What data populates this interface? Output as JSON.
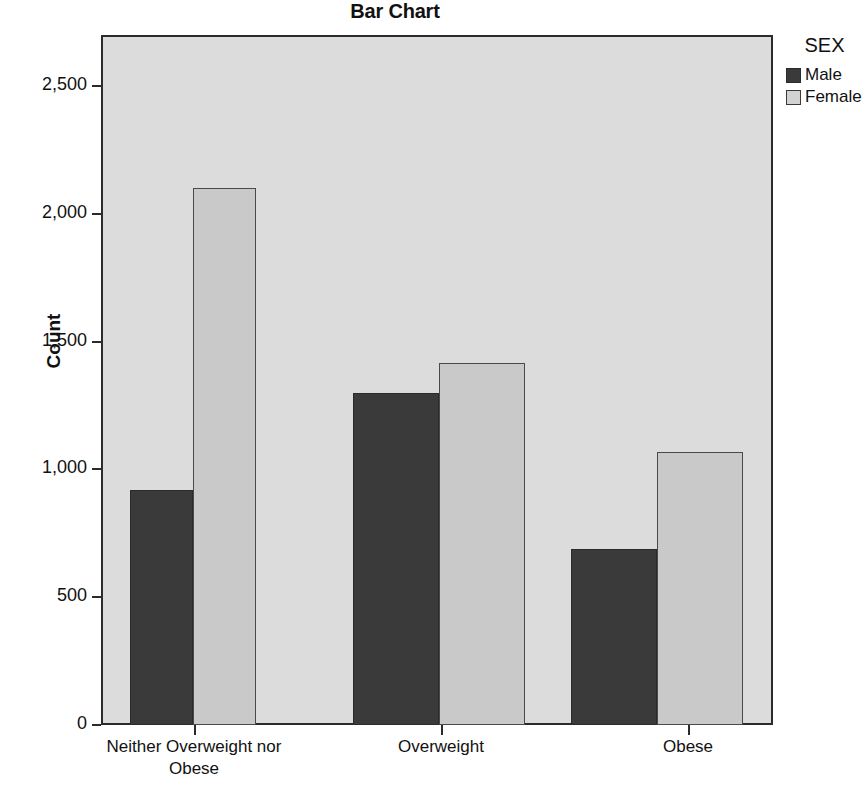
{
  "chart_data": {
    "type": "bar",
    "title": "Bar Chart",
    "xlabel": "",
    "ylabel": "Count",
    "categories": [
      "Neither Overweight nor Obese",
      "Overweight",
      "Obese"
    ],
    "category_lines": [
      [
        "Neither Overweight nor",
        "Obese"
      ],
      [
        "Overweight"
      ],
      [
        "Obese"
      ]
    ],
    "legend_title": "SEX",
    "legend_position": "right",
    "grid": false,
    "ylim": [
      0,
      2700
    ],
    "yticks": [
      0,
      500,
      1000,
      1500,
      2000,
      2500
    ],
    "ytick_labels": [
      "0",
      "500",
      "1,000",
      "1,500",
      "2,000",
      "2,500"
    ],
    "series": [
      {
        "name": "Male",
        "color": "#3a3a3a",
        "values": [
          920,
          1300,
          690
        ]
      },
      {
        "name": "Female",
        "color": "#c9c9c9",
        "values": [
          2100,
          1415,
          1070
        ]
      }
    ]
  },
  "colors": {
    "plot_background": "#dcdcdc",
    "axis": "#2b2b2b",
    "male": "#3a3a3a",
    "female": "#c9c9c9",
    "page_background": "#ffffff"
  }
}
